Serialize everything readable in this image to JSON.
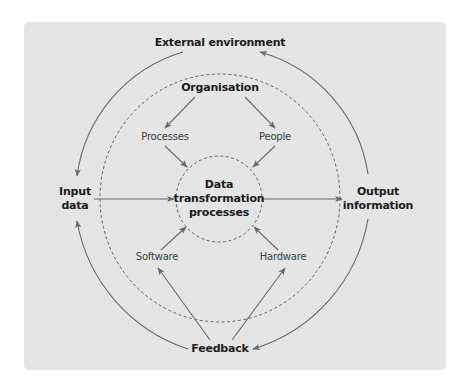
{
  "diagram": {
    "title": "",
    "colors": {
      "page_background": "#ffffff",
      "panel_background": "#e5e5e5",
      "line": "#6a6a6a",
      "dashed": "#555555",
      "text_primary": "#1b1b1b",
      "text_secondary": "#3c3c3c"
    },
    "nodes": {
      "external_environment": "External environment",
      "organisation": "Organisation",
      "processes": "Processes",
      "people": "People",
      "input_data": [
        "Input",
        "data"
      ],
      "core": [
        "Data",
        "transformation",
        "processes"
      ],
      "output_information": [
        "Output",
        "information"
      ],
      "software": "Software",
      "hardware": "Hardware",
      "feedback": "Feedback"
    },
    "edges": [
      {
        "from": "External environment",
        "to": "Input data",
        "style": "solid-arc"
      },
      {
        "from": "Output information",
        "to": "External environment",
        "style": "solid-arc"
      },
      {
        "from": "Feedback",
        "to": "Input data",
        "style": "solid-arc"
      },
      {
        "from": "Output information",
        "to": "Feedback",
        "style": "solid-arc"
      },
      {
        "from": "Input data",
        "to": "Data transformation processes",
        "style": "arrow"
      },
      {
        "from": "Data transformation processes",
        "to": "Output information",
        "style": "arrow"
      },
      {
        "from": "Organisation",
        "to": "Processes",
        "style": "arrow"
      },
      {
        "from": "Organisation",
        "to": "People",
        "style": "arrow"
      },
      {
        "from": "Processes",
        "to": "Data transformation processes",
        "style": "arrow"
      },
      {
        "from": "People",
        "to": "Data transformation processes",
        "style": "arrow"
      },
      {
        "from": "Software",
        "to": "Data transformation processes",
        "style": "arrow"
      },
      {
        "from": "Hardware",
        "to": "Data transformation processes",
        "style": "arrow"
      },
      {
        "from": "Feedback",
        "to": "Software",
        "style": "arrow"
      },
      {
        "from": "Feedback",
        "to": "Hardware",
        "style": "arrow"
      }
    ],
    "boundaries": [
      {
        "name": "organisation-boundary",
        "style": "dashed-circle"
      },
      {
        "name": "core-boundary",
        "style": "dashed-circle"
      }
    ]
  }
}
